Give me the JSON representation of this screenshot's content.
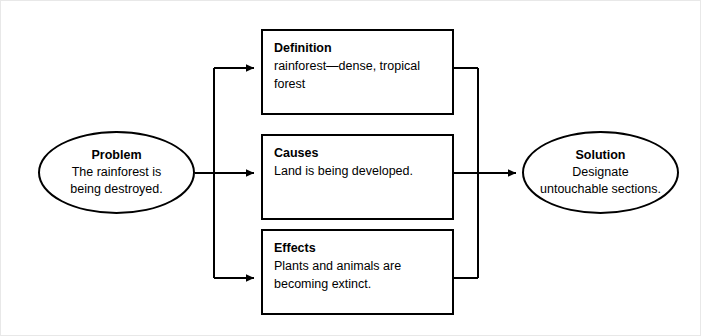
{
  "diagram": {
    "line_color": "#000000",
    "node_fill": "#ffffff",
    "frame_color": "#e8e8e8",
    "nodes": {
      "problem": {
        "shape": "ellipse",
        "title": "Problem",
        "body": "The rainforest is being destroyed."
      },
      "definition": {
        "shape": "rectangle",
        "title": "Definition",
        "body": "rainforest—dense, tropical forest"
      },
      "causes": {
        "shape": "rectangle",
        "title": "Causes",
        "body": "Land is being developed."
      },
      "effects": {
        "shape": "rectangle",
        "title": "Effects",
        "body": "Plants and animals are becoming extinct."
      },
      "solution": {
        "shape": "ellipse",
        "title": "Solution",
        "body": "Designate untouchable sections."
      }
    },
    "connectors": [
      {
        "name": "problem-to-definition",
        "from": "problem",
        "to": "definition",
        "arrow": true
      },
      {
        "name": "problem-to-causes",
        "from": "problem",
        "to": "causes",
        "arrow": true
      },
      {
        "name": "problem-to-effects",
        "from": "problem",
        "to": "effects",
        "arrow": true
      },
      {
        "name": "definition-to-solution",
        "from": "definition",
        "to": "solution",
        "arrow": false
      },
      {
        "name": "causes-to-solution",
        "from": "causes",
        "to": "solution",
        "arrow": true
      },
      {
        "name": "effects-to-solution",
        "from": "effects",
        "to": "solution",
        "arrow": false
      }
    ]
  }
}
